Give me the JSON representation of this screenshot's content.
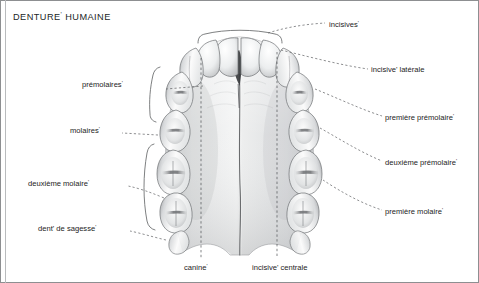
{
  "figure": {
    "title": "DENTURE' HUMAINE",
    "title_text": "DENTURE",
    "title_prime": "'",
    "title_rest": " HUMAINE",
    "width": 479,
    "height": 283,
    "background": "#ffffff",
    "border_color": "#8d8f91",
    "inner_rule_color": "#b9bbbd"
  },
  "palette": {
    "text": "#1d1b1b",
    "leader_line": "#5d5f61",
    "tooth_outline": "#6f7174",
    "tooth_light": "#fdfdfd",
    "tooth_mid": "#d6d8da",
    "tooth_shadow": "#8b8d90",
    "palate_light": "#f1f2f3",
    "palate_mid": "#d9dbdd",
    "palate_dark": "#bcbec0",
    "suture": "#6a6c6e",
    "papilla": "#3a3c3e",
    "bracket": "#5d5f61"
  },
  "labels": {
    "left": [
      {
        "id": "premolaires",
        "text": "prémolaires",
        "prime": "'",
        "x": 161,
        "y": 85,
        "anchor_x": 201,
        "anchor_y": 90
      },
      {
        "id": "molaires",
        "text": "molaires",
        "prime": "'",
        "x": 118,
        "y": 131,
        "anchor_x": 161,
        "anchor_y": 136
      },
      {
        "id": "deuxieme-molaire",
        "text": "deuxième molaire",
        "prime": "'",
        "x": 124,
        "y": 184,
        "anchor_x": 173,
        "anchor_y": 180
      },
      {
        "id": "dent-de-sagesse",
        "text": "dent' de sagesse",
        "prime": "'",
        "x": 126,
        "y": 229,
        "anchor_x": 166,
        "anchor_y": 222
      }
    ],
    "right": [
      {
        "id": "incisives",
        "text": "incisives",
        "prime": "'",
        "x": 328,
        "y": 25,
        "anchor_x": 268,
        "anchor_y": 38
      },
      {
        "id": "incisive-laterale",
        "text": "incisive' latérale",
        "prime": "",
        "x": 371,
        "y": 70,
        "anchor_x": 300,
        "anchor_y": 52
      },
      {
        "id": "premiere-premolaire",
        "text": "première prémolaire",
        "prime": "'",
        "x": 385,
        "y": 118,
        "anchor_x": 319,
        "anchor_y": 92
      },
      {
        "id": "deuxieme-premolaire",
        "text": "deuxième prémolaire",
        "prime": "'",
        "x": 385,
        "y": 163,
        "anchor_x": 330,
        "anchor_y": 130
      },
      {
        "id": "premiere-molaire",
        "text": "première molaire",
        "prime": "'",
        "x": 385,
        "y": 212,
        "anchor_x": 341,
        "anchor_y": 184
      }
    ],
    "bottom": [
      {
        "id": "canine",
        "text": "canine",
        "prime": "'",
        "x": 184,
        "y": 268,
        "tick_x": 201,
        "tick_top": 40,
        "tick_bottom": 258
      },
      {
        "id": "incisive-centrale",
        "text": "incisive' centrale",
        "prime": "",
        "x": 252,
        "y": 268,
        "tick_x": 277,
        "tick_top": 45,
        "tick_bottom": 258
      }
    ]
  },
  "annotations": {
    "dent_de_sagesse_segments": [
      "dent",
      "'",
      " de sagesse",
      "'"
    ],
    "incisive_laterale_segments": [
      "incisive",
      "'",
      " latérale"
    ],
    "incisive_centrale_segments": [
      "incisive",
      "'",
      " centrale"
    ]
  },
  "brackets": [
    {
      "id": "incisors-bracket",
      "group": "incisives",
      "side": "top"
    },
    {
      "id": "premolars-bracket",
      "group": "prémolaires",
      "side": "left"
    },
    {
      "id": "molars-bracket",
      "group": "molaires",
      "side": "left"
    }
  ],
  "teeth": {
    "count_visible": 16,
    "groups": [
      "incisive centrale",
      "incisive latérale",
      "canine",
      "première prémolaire",
      "deuxième prémolaire",
      "première molaire",
      "deuxième molaire",
      "dent de sagesse"
    ]
  }
}
